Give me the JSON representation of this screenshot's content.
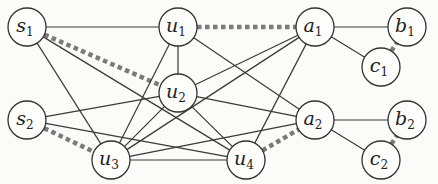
{
  "diagram": {
    "type": "graph",
    "nodes": [
      {
        "id": "s1",
        "base": "s",
        "sub": "1",
        "x": 27,
        "y": 27
      },
      {
        "id": "u1",
        "base": "u",
        "sub": "1",
        "x": 178,
        "y": 27
      },
      {
        "id": "a1",
        "base": "a",
        "sub": "1",
        "x": 315,
        "y": 27
      },
      {
        "id": "b1",
        "base": "b",
        "sub": "1",
        "x": 407,
        "y": 27
      },
      {
        "id": "c1",
        "base": "c",
        "sub": "1",
        "x": 381,
        "y": 67
      },
      {
        "id": "u2",
        "base": "u",
        "sub": "2",
        "x": 178,
        "y": 93
      },
      {
        "id": "s2",
        "base": "s",
        "sub": "2",
        "x": 27,
        "y": 120
      },
      {
        "id": "a2",
        "base": "a",
        "sub": "2",
        "x": 315,
        "y": 120
      },
      {
        "id": "b2",
        "base": "b",
        "sub": "2",
        "x": 407,
        "y": 120
      },
      {
        "id": "u3",
        "base": "u",
        "sub": "3",
        "x": 111,
        "y": 160
      },
      {
        "id": "u4",
        "base": "u",
        "sub": "4",
        "x": 246,
        "y": 160
      },
      {
        "id": "c2",
        "base": "c",
        "sub": "2",
        "x": 381,
        "y": 160
      }
    ],
    "edges": [
      {
        "from": "s1",
        "to": "u1",
        "style": "solid"
      },
      {
        "from": "s1",
        "to": "u3",
        "style": "solid"
      },
      {
        "from": "s1",
        "to": "u4",
        "style": "solid"
      },
      {
        "from": "s1",
        "to": "u2",
        "style": "dashed"
      },
      {
        "from": "u1",
        "to": "u2",
        "style": "solid"
      },
      {
        "from": "u1",
        "to": "u3",
        "style": "solid"
      },
      {
        "from": "u1",
        "to": "a2",
        "style": "solid"
      },
      {
        "from": "u1",
        "to": "a1",
        "style": "dashed"
      },
      {
        "from": "a1",
        "to": "b1",
        "style": "solid"
      },
      {
        "from": "a1",
        "to": "c1",
        "style": "solid"
      },
      {
        "from": "c1",
        "to": "b1",
        "style": "dashed"
      },
      {
        "from": "a1",
        "to": "u2",
        "style": "solid"
      },
      {
        "from": "a1",
        "to": "u3",
        "style": "solid"
      },
      {
        "from": "a1",
        "to": "u4",
        "style": "solid"
      },
      {
        "from": "s2",
        "to": "u2",
        "style": "solid"
      },
      {
        "from": "s2",
        "to": "u4",
        "style": "solid"
      },
      {
        "from": "s2",
        "to": "u3",
        "style": "dashed"
      },
      {
        "from": "u2",
        "to": "a2",
        "style": "solid"
      },
      {
        "from": "u2",
        "to": "u3",
        "style": "solid"
      },
      {
        "from": "u2",
        "to": "u4",
        "style": "solid"
      },
      {
        "from": "u3",
        "to": "u4",
        "style": "solid"
      },
      {
        "from": "u3",
        "to": "a2",
        "style": "solid"
      },
      {
        "from": "u4",
        "to": "a2",
        "style": "dashed"
      },
      {
        "from": "a2",
        "to": "b2",
        "style": "solid"
      },
      {
        "from": "a2",
        "to": "c2",
        "style": "solid"
      },
      {
        "from": "c2",
        "to": "b2",
        "style": "dashed"
      }
    ],
    "node_radius": 19,
    "colors": {
      "solid": "#3a3a3a",
      "dashed": "#7a7a7a",
      "node_fill": "#fdfdfb",
      "node_stroke": "#333333"
    }
  }
}
